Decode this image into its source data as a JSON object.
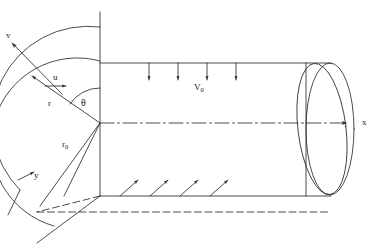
{
  "figure": {
    "stroke_color": "#2b2b2b",
    "background_color": "#ffffff",
    "labels": {
      "v_velocity": "v",
      "u_velocity": "u",
      "radius": "r",
      "outer_radius": "r",
      "outer_radius_sub": "0",
      "angle": "θ",
      "freestream": "V",
      "freestream_sub": "0",
      "axis_x": "x",
      "axis_y": "y"
    },
    "geometry": {
      "origin": {
        "x": 100,
        "y": 123
      },
      "axis_x_end": {
        "x": 352,
        "y": 123
      },
      "cylinder_top_y": 63,
      "cylinder_bottom_y": 196,
      "cylinder_left_x": 100,
      "cylinder_right_x": 330,
      "end_cap_rx": 24,
      "end_cap_ry": 66,
      "vertical_line_top_y": 12,
      "arc_outer_radius": 96,
      "arc_inner_radius": 62,
      "theta_deg": 47
    },
    "flow_arrows": {
      "top_count": 4,
      "top_label": "V0 downward crossflow",
      "bottom_count": 4,
      "bottom_label": "inclined upward arrows"
    }
  }
}
